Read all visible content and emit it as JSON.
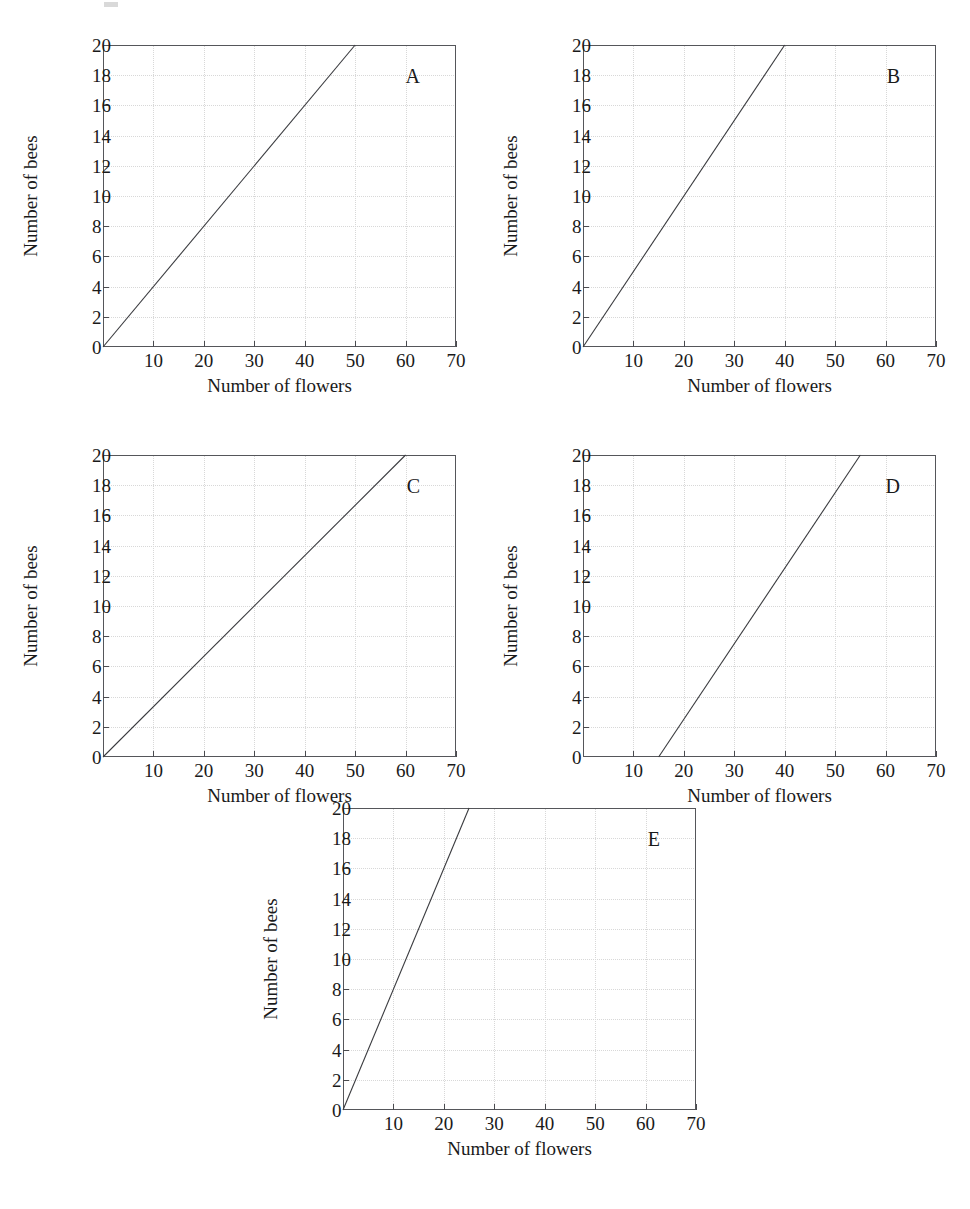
{
  "figure": {
    "panel_count": 5,
    "axis": {
      "x_title": "Number of flowers",
      "y_title": "Number of bees",
      "x_ticks": [
        10,
        20,
        30,
        40,
        50,
        60,
        70
      ],
      "x_tick_labels": [
        "10",
        "20",
        "30",
        "40",
        "50",
        "60",
        "70"
      ],
      "y_ticks": [
        0,
        2,
        4,
        6,
        8,
        10,
        12,
        14,
        16,
        18,
        20
      ],
      "y_tick_labels": [
        "0",
        "2",
        "4",
        "6",
        "8",
        "10",
        "12",
        "14",
        "16",
        "18",
        "20"
      ],
      "xlim": [
        0,
        70
      ],
      "ylim": [
        0,
        20
      ]
    },
    "colors": {
      "line": "#3a3b3f",
      "frame": "#55565a",
      "grid": "#d8d8d8",
      "text": "#1a1a1a",
      "background": "#ffffff"
    },
    "panels": [
      {
        "id": "A",
        "label": "A",
        "x_title": "Number of flowers",
        "y_title": "Number of bees",
        "line": {
          "x0": 0,
          "y0": 0,
          "x1": 50,
          "y1": 20,
          "slope": 0.4,
          "x_intercept": 0,
          "y_intercept": 0
        }
      },
      {
        "id": "B",
        "label": "B",
        "x_title": "Number of flowers",
        "y_title": "Number of bees",
        "line": {
          "x0": 0,
          "y0": 0,
          "x1": 40,
          "y1": 20,
          "slope": 0.5,
          "x_intercept": 0,
          "y_intercept": 0
        }
      },
      {
        "id": "C",
        "label": "C",
        "x_title": "Number of flowers",
        "y_title": "Number of bees",
        "line": {
          "x0": 0,
          "y0": 0,
          "x1": 60,
          "y1": 20,
          "slope": 0.3333,
          "x_intercept": 0,
          "y_intercept": 0
        }
      },
      {
        "id": "D",
        "label": "D",
        "x_title": "Number of flowers",
        "y_title": "Number of bees",
        "line": {
          "x0": 15,
          "y0": 0,
          "x1": 55,
          "y1": 20,
          "slope": 0.5,
          "x_intercept": 15,
          "y_intercept": -7.5
        }
      },
      {
        "id": "E",
        "label": "E",
        "x_title": "Number of flowers",
        "y_title": "Number of bees",
        "line": {
          "x0": 0,
          "y0": 0,
          "x1": 25,
          "y1": 20,
          "slope": 0.8,
          "x_intercept": 0,
          "y_intercept": 0
        }
      }
    ]
  },
  "chart_data": {
    "type": "line",
    "title": "",
    "xlabel": "Number of flowers",
    "ylabel": "Number of bees",
    "xlim": [
      0,
      70
    ],
    "ylim": [
      0,
      20
    ],
    "xticks": [
      10,
      20,
      30,
      40,
      50,
      60,
      70
    ],
    "yticks": [
      0,
      2,
      4,
      6,
      8,
      10,
      12,
      14,
      16,
      18,
      20
    ],
    "grid": true,
    "legend": "none",
    "subplots": [
      {
        "panel": "A",
        "x": [
          0,
          50
        ],
        "y": [
          0,
          20
        ],
        "slope": 0.4,
        "intercept": 0,
        "description": "Straight line through origin reaching 20 bees at 50 flowers"
      },
      {
        "panel": "B",
        "x": [
          0,
          40
        ],
        "y": [
          0,
          20
        ],
        "slope": 0.5,
        "intercept": 0,
        "description": "Straight line through origin reaching 20 bees at 40 flowers"
      },
      {
        "panel": "C",
        "x": [
          0,
          60
        ],
        "y": [
          0,
          20
        ],
        "slope": 0.3333,
        "intercept": 0,
        "description": "Straight line through origin reaching 20 bees at 60 flowers"
      },
      {
        "panel": "D",
        "x": [
          15,
          55
        ],
        "y": [
          0,
          20
        ],
        "slope": 0.5,
        "intercept": -7.5,
        "description": "Straight line starting at 15 flowers on the x-axis reaching 20 bees at 55 flowers"
      },
      {
        "panel": "E",
        "x": [
          0,
          25
        ],
        "y": [
          0,
          20
        ],
        "slope": 0.8,
        "intercept": 0,
        "description": "Straight line through origin reaching 20 bees at 25 flowers"
      }
    ]
  }
}
